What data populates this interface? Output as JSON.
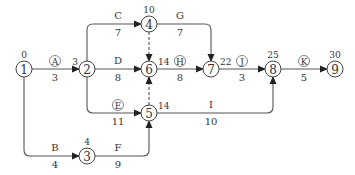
{
  "diagram": {
    "type": "activity-on-arrow network",
    "nodes": [
      {
        "id": "1",
        "label": "1",
        "time": "0",
        "x": 24,
        "y": 69
      },
      {
        "id": "2",
        "label": "2",
        "time": "3",
        "x": 87,
        "y": 69
      },
      {
        "id": "3",
        "label": "3",
        "time": "4",
        "x": 87,
        "y": 156
      },
      {
        "id": "4",
        "label": "4",
        "time": "10",
        "x": 149,
        "y": 24
      },
      {
        "id": "5",
        "label": "5",
        "time": "14",
        "x": 149,
        "y": 113
      },
      {
        "id": "6",
        "label": "6",
        "time": "14",
        "x": 149,
        "y": 69
      },
      {
        "id": "7",
        "label": "7",
        "time": "22",
        "x": 211,
        "y": 69
      },
      {
        "id": "8",
        "label": "8",
        "time": "25",
        "x": 273,
        "y": 69
      },
      {
        "id": "9",
        "label": "9",
        "time": "30",
        "x": 335,
        "y": 69
      }
    ],
    "activities": [
      {
        "name": "A",
        "circled": true,
        "duration": "3",
        "from": "1",
        "to": "2"
      },
      {
        "name": "B",
        "circled": false,
        "duration": "4",
        "from": "1",
        "to": "3"
      },
      {
        "name": "C",
        "circled": false,
        "duration": "7",
        "from": "2",
        "to": "4"
      },
      {
        "name": "D",
        "circled": false,
        "duration": "8",
        "from": "2",
        "to": "6"
      },
      {
        "name": "E",
        "circled": true,
        "duration": "11",
        "from": "2",
        "to": "5"
      },
      {
        "name": "F",
        "circled": false,
        "duration": "9",
        "from": "3",
        "to": "5"
      },
      {
        "name": "G",
        "circled": false,
        "duration": "7",
        "from": "4",
        "to": "7"
      },
      {
        "name": "H",
        "circled": true,
        "duration": "8",
        "from": "6",
        "to": "7"
      },
      {
        "name": "I",
        "circled": false,
        "duration": "10",
        "from": "5",
        "to": "8"
      },
      {
        "name": "J",
        "circled": true,
        "duration": "3",
        "from": "7",
        "to": "8"
      },
      {
        "name": "K",
        "circled": true,
        "duration": "5",
        "from": "8",
        "to": "9"
      }
    ],
    "dummies": [
      {
        "from": "4",
        "to": "6"
      },
      {
        "from": "5",
        "to": "6"
      }
    ]
  },
  "colors": {
    "line": "#555555",
    "text": "#333333",
    "background": "#ffffff"
  }
}
